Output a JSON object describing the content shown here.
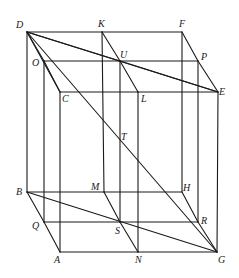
{
  "figure": {
    "type": "geometric-construction",
    "points": {
      "D": "D",
      "K": "K",
      "F": "F",
      "O": "O",
      "U": "U",
      "P": "P",
      "C": "C",
      "L": "L",
      "E": "E",
      "T": "T",
      "B": "B",
      "M": "M",
      "H": "H",
      "Q": "Q",
      "S": "S",
      "R": "R",
      "A": "A",
      "N": "N",
      "G": "G"
    },
    "segments": [
      [
        "D",
        "K"
      ],
      [
        "K",
        "F"
      ],
      [
        "O",
        "U"
      ],
      [
        "U",
        "P"
      ],
      [
        "C",
        "L"
      ],
      [
        "L",
        "E"
      ],
      [
        "B",
        "M"
      ],
      [
        "M",
        "H"
      ],
      [
        "Q",
        "S"
      ],
      [
        "S",
        "R"
      ],
      [
        "A",
        "N"
      ],
      [
        "N",
        "G"
      ],
      [
        "D",
        "B"
      ],
      [
        "K",
        "M"
      ],
      [
        "F",
        "H"
      ],
      [
        "O",
        "Q"
      ],
      [
        "U",
        "S"
      ],
      [
        "P",
        "R"
      ],
      [
        "C",
        "A"
      ],
      [
        "L",
        "N"
      ],
      [
        "E",
        "G"
      ],
      [
        "D",
        "O"
      ],
      [
        "O",
        "C"
      ],
      [
        "K",
        "U"
      ],
      [
        "U",
        "L"
      ],
      [
        "F",
        "P"
      ],
      [
        "P",
        "E"
      ],
      [
        "B",
        "Q"
      ],
      [
        "Q",
        "A"
      ],
      [
        "M",
        "S"
      ],
      [
        "S",
        "N"
      ],
      [
        "H",
        "R"
      ],
      [
        "R",
        "G"
      ],
      [
        "D",
        "G"
      ],
      [
        "D",
        "E"
      ],
      [
        "U",
        "E"
      ],
      [
        "B",
        "G"
      ],
      [
        "D",
        "C"
      ],
      [
        "D",
        "U"
      ]
    ]
  }
}
